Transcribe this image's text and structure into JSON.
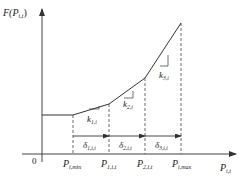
{
  "axes": {
    "y_label_main": "F(P",
    "y_label_sub": "i,t",
    "y_label_close": ")",
    "x_label_main": "P",
    "x_label_sub": "i,t",
    "origin": "0"
  },
  "ticks": [
    {
      "main": "P",
      "sub": "i,min"
    },
    {
      "main": "P",
      "sub": "1,i,t"
    },
    {
      "main": "P",
      "sub": "2,i,t"
    },
    {
      "main": "P",
      "sub": "i,max"
    }
  ],
  "slopes": [
    {
      "main": "k",
      "sub": "1,i"
    },
    {
      "main": "k",
      "sub": "2,i"
    },
    {
      "main": "k",
      "sub": "3,i"
    }
  ],
  "segments": [
    {
      "main": "δ",
      "sub": "1,i,t"
    },
    {
      "main": "δ",
      "sub": "2,i,t"
    },
    {
      "main": "δ",
      "sub": "3,i,t"
    }
  ],
  "colors": {
    "line": "#333333",
    "dashed": "#444444",
    "text": "#222222"
  }
}
